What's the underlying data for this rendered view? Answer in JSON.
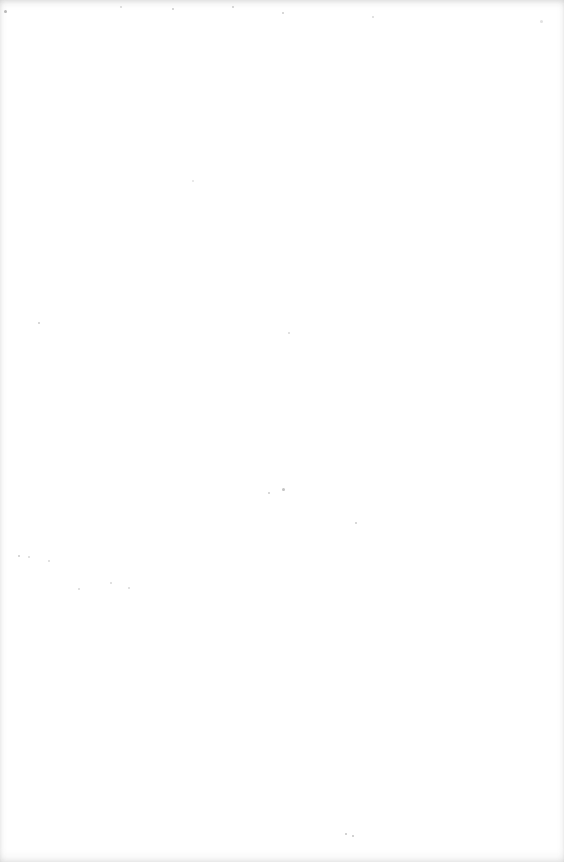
{
  "document": {
    "type": "blank-scanned-page",
    "text": "",
    "speckles": [
      {
        "x": 4,
        "y": 10,
        "s": 3,
        "o": 0.7
      },
      {
        "x": 120,
        "y": 6,
        "s": 2,
        "o": 0.4
      },
      {
        "x": 172,
        "y": 8,
        "s": 2,
        "o": 0.5
      },
      {
        "x": 232,
        "y": 6,
        "s": 2,
        "o": 0.5
      },
      {
        "x": 282,
        "y": 12,
        "s": 2,
        "o": 0.5
      },
      {
        "x": 372,
        "y": 16,
        "s": 2,
        "o": 0.4
      },
      {
        "x": 540,
        "y": 20,
        "s": 3,
        "o": 0.3
      },
      {
        "x": 38,
        "y": 322,
        "s": 2,
        "o": 0.5
      },
      {
        "x": 192,
        "y": 180,
        "s": 2,
        "o": 0.3
      },
      {
        "x": 288,
        "y": 332,
        "s": 2,
        "o": 0.4
      },
      {
        "x": 18,
        "y": 555,
        "s": 2,
        "o": 0.5
      },
      {
        "x": 28,
        "y": 556,
        "s": 2,
        "o": 0.4
      },
      {
        "x": 48,
        "y": 560,
        "s": 2,
        "o": 0.4
      },
      {
        "x": 78,
        "y": 588,
        "s": 2,
        "o": 0.4
      },
      {
        "x": 110,
        "y": 582,
        "s": 2,
        "o": 0.4
      },
      {
        "x": 128,
        "y": 587,
        "s": 2,
        "o": 0.4
      },
      {
        "x": 268,
        "y": 492,
        "s": 2,
        "o": 0.5
      },
      {
        "x": 282,
        "y": 488,
        "s": 3,
        "o": 0.6
      },
      {
        "x": 355,
        "y": 522,
        "s": 2,
        "o": 0.5
      },
      {
        "x": 345,
        "y": 833,
        "s": 2,
        "o": 0.6
      },
      {
        "x": 352,
        "y": 835,
        "s": 2,
        "o": 0.6
      }
    ]
  }
}
